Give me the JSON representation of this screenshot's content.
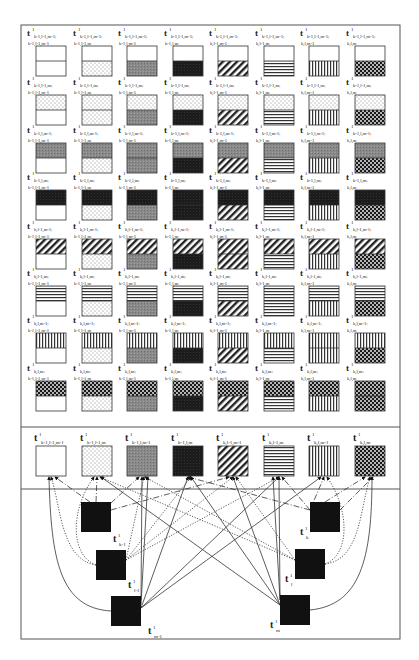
{
  "figure": {
    "patterns": [
      "white",
      "dots",
      "gray",
      "black",
      "diagonal",
      "horizontal",
      "vertical",
      "checker"
    ],
    "grid_rows": [
      {
        "top_pattern": "white",
        "row_prefix_a": "k-1,l-1,m-1",
        "row_prefix_b": "k-1,l-1,m"
      },
      {
        "top_pattern": "dots",
        "row_prefix_a": "k-1,l-1,m",
        "row_prefix_b": "k-1,l,m-1"
      },
      {
        "top_pattern": "gray",
        "row_prefix_a": "k-1,l,m-1",
        "row_prefix_b": "k-1,l,m"
      },
      {
        "top_pattern": "black",
        "row_prefix_a": "k-1,l,m",
        "row_prefix_b": "k,l-1,m-1"
      },
      {
        "top_pattern": "diagonal",
        "row_prefix_a": "k,l-1,m-1",
        "row_prefix_b": "k,l-1,m"
      },
      {
        "top_pattern": "horizontal",
        "row_prefix_a": "k,l-1,m",
        "row_prefix_b": "k,l,m-1"
      },
      {
        "top_pattern": "vertical",
        "row_prefix_a": "k,l,m-1",
        "row_prefix_b": "k,l,m"
      },
      {
        "top_pattern": "checker",
        "row_prefix_a": "k,l,m",
        "row_prefix_b": ""
      }
    ],
    "grid_columns": [
      {
        "bottom_pattern": "white",
        "suffix": "k-1,l-1,m-1"
      },
      {
        "bottom_pattern": "dots",
        "suffix": "k-1,l-1,m"
      },
      {
        "bottom_pattern": "gray",
        "suffix": "k-1,l,m-1"
      },
      {
        "bottom_pattern": "black",
        "suffix": "k-1,l,m"
      },
      {
        "bottom_pattern": "diagonal",
        "suffix": "k,l-1,m-1"
      },
      {
        "bottom_pattern": "horizontal",
        "suffix": "k,l-1,m"
      },
      {
        "bottom_pattern": "vertical",
        "suffix": "k,l,m-1"
      },
      {
        "bottom_pattern": "checker",
        "suffix": "k,l,m"
      }
    ],
    "cell_labels": [
      [
        "k-1,l-1,m-1; k-1,l-1,m-1",
        "k-1,l-1,m-1; k-1,l-1,m",
        "k-1,l-1,m-1; k-1,l,m-1",
        "k-1,l-1,m-1; k-1,l,m",
        "k-1,l-1,m-1; k,l-1,m-1",
        "k-1,l-1,m-1; k,l-1,m",
        "k-1,l-1,m-1; k,l,m-1",
        "k-1,l-1,m-1; k,l,m"
      ],
      [
        "k-1,l-1,m; k-1,l-1,m-1",
        "k-1,l-1,m; k-1,l-1,m",
        "k-1,l-1,m; k-1,l,m-1",
        "k-1,l-1,m; k-1,l,m",
        "k-1,l-1,m; k,l-1,m-1",
        "k-1,l-1,m; k,l-1,m",
        "k-1,l-1,m; k,l,m-1",
        "k-1,l-1,m; k,l,m"
      ],
      [
        "k-1,l,m-1; k-1,l-1,m-1",
        "k-1,l,m-1; k-1,l-1,m",
        "k-1,l,m-1; k-1,l,m-1",
        "k-1,l,m-1; k-1,l,m",
        "k-1,l,m-1; k,l-1,m-1",
        "k-1,l,m-1; k,l-1,m",
        "k-1,l,m-1; k,l,m-1",
        "k-1,l,m-1; k,l,m"
      ],
      [
        "k-1,l,m; k-1,l-1,m-1",
        "k-1,l,m; k-1,l-1,m",
        "k-1,l,m; k-1,l,m-1",
        "k-1,l,m; k-1,l,m",
        "k-1,l,m; k,l-1,m-1",
        "k-1,l,m; k,l-1,m",
        "k-1,l,m; k,l,m-1",
        "k-1,l,m; k,l,m"
      ],
      [
        "k,l-1,m-1; k-1,l-1,m-1",
        "k,l-1,m-1; k-1,l-1,m",
        "k,l-1,m-1; k-1,l,m-1",
        "k,l-1,m-1; k-1,l,m",
        "k,l-1,m-1; k,l-1,m-1",
        "k,l-1,m-1; k,l-1,m",
        "k,l-1,m-1; k,l,m-1",
        "k,l-1,m-1; k,l,m"
      ],
      [
        "k,l-1,m; k-1,l-1,m-1",
        "k,l-1,m; k-1,l-1,m",
        "k,l-1,m; k-1,l,m-1",
        "k,l-1,m; k-1,l,m",
        "k,l-1,m; k,l-1,m-1",
        "k,l-1,m; k,l-1,m",
        "k,l-1,m; k,l,m-1",
        "k,l-1,m; k,l,m"
      ],
      [
        "k,l,m-1; k-1,l-1,m-1",
        "k,l,m-1; k-1,l-1,m",
        "k,l,m-1; k-1,l,m-1",
        "k,l,m-1; k-1,l,m",
        "k,l,m-1; k,l-1,m-1",
        "k,l,m-1; k,l-1,m",
        "k,l,m-1; k,l,m-1",
        "k,l,m-1; k,l,m"
      ],
      [
        "k,l,m; k-1,l-1,m-1",
        "k,l,m; k-1,l-1,m",
        "k,l,m; k-1,l,m-1",
        "k,l,m; k-1,l,m",
        "k,l,m; k,l-1,m-1",
        "k,l,m; k,l-1,m",
        "k,l,m; k,l,m-1",
        "k,l,m; k,l,m"
      ]
    ],
    "label_base": "t",
    "label_sup": "1",
    "middle_labels": [
      "k-1,l-1,m-1",
      "k-1,l-1,m",
      "k-1,l,m-1",
      "k-1,l,m",
      "k,l-1,m-1",
      "k,l-1,m",
      "k,l,m-1",
      "k,l,m"
    ],
    "node_labels": {
      "k_minus_1": "k-1",
      "l_minus_1": "l-1",
      "m_minus_1": "m-1",
      "k": "k",
      "l": "l",
      "m": "m"
    }
  }
}
